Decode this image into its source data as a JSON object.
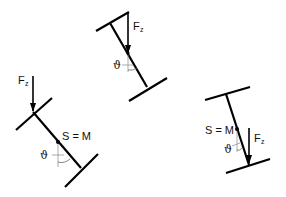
{
  "colors": {
    "stroke": "#000000",
    "thin": "#888888",
    "background": "#ffffff"
  },
  "diagrams": [
    {
      "id": "top",
      "force_label": "F",
      "force_sub": "z",
      "angle_label": "ϑ"
    },
    {
      "id": "left",
      "force_label": "F",
      "force_sub": "z",
      "angle_label": "ϑ",
      "point_label": "S = M"
    },
    {
      "id": "right",
      "force_label": "F",
      "force_sub": "z",
      "angle_label": "ϑ",
      "point_label": "S = M"
    }
  ]
}
